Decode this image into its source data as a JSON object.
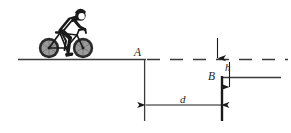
{
  "figure": {
    "canvas": {
      "width": 291,
      "height": 133,
      "background": "#ffffff"
    },
    "labels": {
      "point_a": "A",
      "point_b": "B",
      "height": "h",
      "distance": "d"
    },
    "colors": {
      "line": "#3a3a3a",
      "ink": "#1a1a1a",
      "wheel_fill": "#9a9a9a",
      "tire": "#2b2b2b",
      "rider": "#1a1a1a",
      "frame_outline": "#1a1a1a"
    },
    "geometry": {
      "upper_ground_y": 59,
      "lower_ground_y": 77,
      "edge_a_x": 144,
      "edge_b_x": 222,
      "upper_ground_x_start": 18,
      "dash_x_end": 288,
      "lower_ground_x_end": 281,
      "dim_d_y": 105,
      "drop_bottom_y": 121
    },
    "elements": {
      "ground_line": "upper-ground-line",
      "dashed_reference_line": "dashed-extension-of-upper-ground",
      "ledge_line": "lower-ground-line",
      "vertical_a": "vertical-drop-line-at-a",
      "vertical_b": "vertical-edge-line-at-b",
      "dimension_h": "vertical-height-dimension",
      "dimension_d": "horizontal-distance-dimension",
      "bicycle": "bicycle-with-rider"
    }
  }
}
